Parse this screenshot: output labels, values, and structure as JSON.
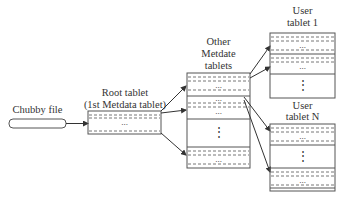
{
  "diagram": {
    "chubby_file": {
      "label": "Chubby file"
    },
    "root_tablet": {
      "title_line1": "Root tablet",
      "title_line2": "(1st Metdata tablet)",
      "ellipsis": "..."
    },
    "other_metadata": {
      "title_line1": "Other",
      "title_line2": "Metdate",
      "title_line3": "tablets",
      "ellipsis": "...",
      "vertical_ellipsis": "⋮"
    },
    "user_tablet_1": {
      "title_line1": "User",
      "title_line2": "tablet 1",
      "ellipsis": "...",
      "vertical_ellipsis": "⋮"
    },
    "user_tablet_n": {
      "title_line1": "User",
      "title_line2": "tablet N",
      "ellipsis": "...",
      "vertical_ellipsis": "⋮"
    }
  },
  "colors": {
    "stroke": "#555555",
    "dash": "#777777",
    "background": "#ffffff"
  }
}
